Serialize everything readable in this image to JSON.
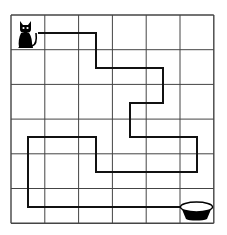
{
  "puzzle": {
    "type": "grid-maze-path",
    "grid": {
      "rows": 6,
      "cols": 6,
      "left": 11,
      "top": 15,
      "cell_w": 33.8,
      "cell_h": 34.7
    },
    "start": {
      "label": "cat",
      "icon": "cat-icon",
      "cell": [
        0,
        0
      ]
    },
    "end": {
      "label": "bowl",
      "icon": "bowl-icon",
      "cell": [
        5,
        5
      ]
    },
    "path_points": [
      [
        38,
        33
      ],
      [
        96,
        33
      ],
      [
        96,
        68
      ],
      [
        163,
        68
      ],
      [
        163,
        103
      ],
      [
        130,
        103
      ],
      [
        130,
        137
      ],
      [
        197,
        137
      ],
      [
        197,
        172
      ],
      [
        96,
        172
      ],
      [
        96,
        137
      ],
      [
        28,
        137
      ],
      [
        28,
        207
      ],
      [
        183,
        207
      ]
    ],
    "colors": {
      "grid": "#444444",
      "path": "#111111",
      "icon": "#000000",
      "background": "#ffffff"
    }
  }
}
